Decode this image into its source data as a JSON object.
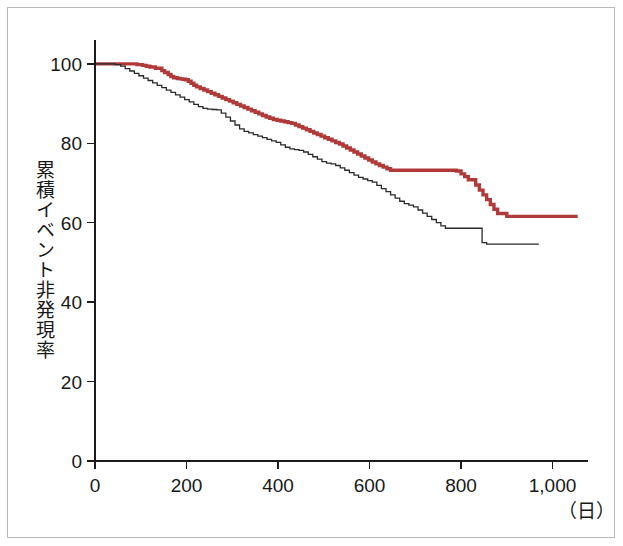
{
  "figure": {
    "background_color": "#ffffff",
    "frame_color": "#b9b9b9",
    "y_axis_title": "累積イベント非発現率",
    "x_unit_label": "（日）"
  },
  "chart_data": {
    "type": "line",
    "subtype": "kaplan-meier-step",
    "title": "",
    "subtitle": "",
    "xlabel": "（日）",
    "ylabel": "累積イベント非発現率",
    "xlim": [
      0,
      1060
    ],
    "ylim": [
      0,
      106
    ],
    "xticks": [
      0,
      200,
      400,
      600,
      800,
      1000
    ],
    "xtick_labels": [
      "0",
      "200",
      "400",
      "600",
      "800",
      "1,000"
    ],
    "yticks": [
      0,
      20,
      40,
      60,
      80,
      100
    ],
    "ytick_labels": [
      "0",
      "20",
      "40",
      "60",
      "80",
      "100"
    ],
    "grid": false,
    "legend": null,
    "legend_position": "none",
    "series": [
      {
        "name": "red-curve",
        "color": "#b03a3a",
        "stroke_width": 3.4,
        "step": "post",
        "x": [
          0,
          18,
          34,
          52,
          66,
          80,
          92,
          104,
          112,
          120,
          132,
          146,
          152,
          160,
          166,
          172,
          180,
          186,
          192,
          198,
          204,
          210,
          216,
          222,
          230,
          238,
          246,
          254,
          262,
          270,
          278,
          286,
          294,
          302,
          310,
          318,
          326,
          334,
          342,
          350,
          358,
          366,
          374,
          382,
          390,
          398,
          406,
          414,
          422,
          430,
          438,
          446,
          454,
          462,
          470,
          478,
          486,
          494,
          502,
          510,
          518,
          526,
          534,
          542,
          550,
          558,
          566,
          574,
          582,
          590,
          598,
          606,
          614,
          622,
          630,
          638,
          646,
          660,
          680,
          700,
          720,
          740,
          760,
          775,
          790,
          800,
          808,
          816,
          824,
          832,
          840,
          848,
          856,
          864,
          872,
          880,
          900,
          930,
          960,
          990,
          1020,
          1055
        ],
        "y": [
          100,
          100,
          100,
          100,
          100,
          100,
          99.8,
          99.6,
          99.4,
          99.2,
          98.9,
          98.3,
          97.8,
          97.3,
          96.8,
          96.5,
          96.3,
          96.2,
          96.1,
          96.0,
          95.6,
          95.1,
          94.6,
          94.2,
          93.8,
          93.4,
          93.0,
          92.6,
          92.2,
          91.8,
          91.4,
          91.0,
          90.6,
          90.2,
          89.8,
          89.4,
          89.0,
          88.6,
          88.2,
          87.8,
          87.4,
          87.0,
          86.6,
          86.3,
          86.0,
          85.8,
          85.6,
          85.4,
          85.2,
          85.0,
          84.6,
          84.2,
          83.8,
          83.4,
          83.0,
          82.6,
          82.2,
          81.8,
          81.4,
          81.0,
          80.6,
          80.2,
          79.8,
          79.3,
          78.8,
          78.3,
          77.8,
          77.3,
          76.8,
          76.3,
          75.8,
          75.3,
          74.8,
          74.4,
          74.0,
          73.6,
          73.2,
          73.2,
          73.2,
          73.2,
          73.2,
          73.2,
          73.2,
          73.2,
          73.0,
          72.3,
          71.6,
          70.8,
          70.8,
          69.5,
          68.2,
          67.0,
          65.8,
          64.6,
          63.4,
          62.3,
          61.6,
          61.6,
          61.6,
          61.6,
          61.6,
          61.6
        ]
      },
      {
        "name": "black-curve",
        "color": "#2a2a2a",
        "stroke_width": 1.3,
        "step": "post",
        "x": [
          0,
          16,
          30,
          44,
          56,
          66,
          76,
          86,
          96,
          106,
          116,
          126,
          136,
          146,
          156,
          166,
          176,
          186,
          196,
          206,
          216,
          226,
          236,
          246,
          256,
          266,
          276,
          286,
          296,
          306,
          316,
          326,
          336,
          346,
          356,
          366,
          376,
          386,
          396,
          406,
          416,
          426,
          436,
          446,
          456,
          466,
          476,
          486,
          496,
          506,
          516,
          526,
          536,
          546,
          556,
          566,
          576,
          586,
          596,
          606,
          616,
          626,
          636,
          646,
          656,
          666,
          676,
          686,
          696,
          706,
          716,
          726,
          736,
          746,
          756,
          766,
          776,
          786,
          796,
          806,
          816,
          826,
          836,
          846,
          856,
          880,
          910,
          940,
          970
        ],
        "y": [
          100,
          100,
          100,
          99.8,
          99.4,
          98.8,
          98.2,
          97.6,
          97.0,
          96.4,
          95.8,
          95.2,
          94.6,
          94.0,
          93.4,
          92.8,
          92.2,
          91.6,
          91.0,
          90.4,
          89.8,
          89.2,
          88.8,
          88.6,
          88.5,
          88.4,
          87.6,
          86.6,
          85.6,
          84.6,
          83.6,
          83.0,
          82.6,
          82.2,
          81.8,
          81.4,
          81.0,
          80.6,
          80.2,
          79.6,
          79.0,
          78.6,
          78.4,
          78.2,
          77.8,
          77.2,
          76.6,
          76.0,
          75.4,
          75.0,
          74.8,
          74.4,
          73.8,
          73.2,
          72.6,
          72.0,
          71.4,
          71.0,
          70.6,
          70.2,
          69.4,
          68.6,
          67.8,
          67.0,
          66.2,
          65.4,
          64.8,
          64.4,
          64.0,
          63.2,
          62.4,
          61.6,
          60.8,
          60.0,
          59.2,
          58.6,
          58.6,
          58.6,
          58.6,
          58.6,
          58.6,
          58.6,
          58.6,
          55.0,
          54.6,
          54.6,
          54.6,
          54.6,
          54.6
        ]
      }
    ],
    "annotations": []
  },
  "axes_geometry": {
    "plot_left_px": 95,
    "plot_right_px": 580,
    "plot_bottom_px": 461,
    "plot_top_px": 40
  }
}
